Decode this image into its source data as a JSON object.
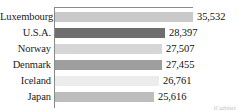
{
  "chart_data": {
    "type": "bar",
    "orientation": "horizontal",
    "title": "",
    "subtitle": "",
    "xlabel": "",
    "ylabel": "",
    "grid": false,
    "legend": "none",
    "xlim": [
      0,
      35532
    ],
    "categories": [
      "Luxembourg",
      "U.S.A.",
      "Norway",
      "Denmark",
      "Iceland",
      "Japan"
    ],
    "values": [
      35532,
      28397,
      27507,
      27455,
      26761,
      25616
    ],
    "value_labels": [
      "35,532",
      "28,397",
      "27,507",
      "27,455",
      "26,761",
      "25,616"
    ],
    "bar_colors": [
      "#c9c9c9",
      "#6e6e6e",
      "#d6d6d6",
      "#9e9e9e",
      "#ececec",
      "#bdbdbd"
    ],
    "bars": [
      {
        "category": "Luxembourg",
        "value": 35532,
        "label": "35,532",
        "color": "#c9c9c9",
        "width_pct": 100.0
      },
      {
        "category": "U.S.A.",
        "value": 28397,
        "label": "28,397",
        "color": "#6e6e6e",
        "width_pct": 79.9
      },
      {
        "category": "Norway",
        "value": 27507,
        "label": "27,507",
        "color": "#d6d6d6",
        "width_pct": 77.4
      },
      {
        "category": "Denmark",
        "value": 27455,
        "label": "27,455",
        "color": "#9e9e9e",
        "width_pct": 77.3
      },
      {
        "category": "Iceland",
        "value": 26761,
        "label": "26,761",
        "color": "#ececec",
        "width_pct": 75.3
      },
      {
        "category": "Japan",
        "value": 25616,
        "label": "25,616",
        "color": "#bdbdbd",
        "width_pct": 72.1
      }
    ]
  },
  "watermark": {
    "text": "iCabinet"
  },
  "colors": {
    "axis_line": "#8a8a8a",
    "label_text": "#1a1a1a",
    "value_text": "#111111",
    "background": "#ffffff",
    "watermark_text": "#b9b9b9"
  }
}
